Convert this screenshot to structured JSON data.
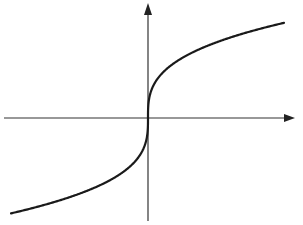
{
  "chart_data": {
    "type": "line",
    "title": "",
    "xlabel": "",
    "ylabel": "",
    "function": "y = cbrt(x)",
    "x": [
      -8,
      -6,
      -4,
      -2,
      -1,
      -0.5,
      -0.1,
      0,
      0.1,
      0.5,
      1,
      2,
      4,
      6,
      8
    ],
    "series": [
      {
        "name": "y = cbrt(x)",
        "values": [
          -2,
          -1.817,
          -1.587,
          -1.26,
          -1,
          -0.794,
          -0.464,
          0,
          0.464,
          0.794,
          1,
          1.26,
          1.587,
          1.817,
          2
        ]
      }
    ],
    "xlim": [
      -8.6,
      8.6
    ],
    "ylim": [
      -2.1,
      2.3
    ],
    "grid": false,
    "legend": null,
    "tick_labels": false,
    "axes_arrows": true,
    "colors": {
      "curve": "#1a1a1a",
      "axes": "#333333",
      "background": "#ffffff"
    }
  },
  "layout": {
    "origin_px": [
      148,
      118
    ],
    "x_axis_px": [
      4,
      295
    ],
    "y_axis_px": [
      3,
      221
    ],
    "curve_scale_px": 18.5,
    "curve_x_range_px": [
      -137,
      136
    ]
  }
}
